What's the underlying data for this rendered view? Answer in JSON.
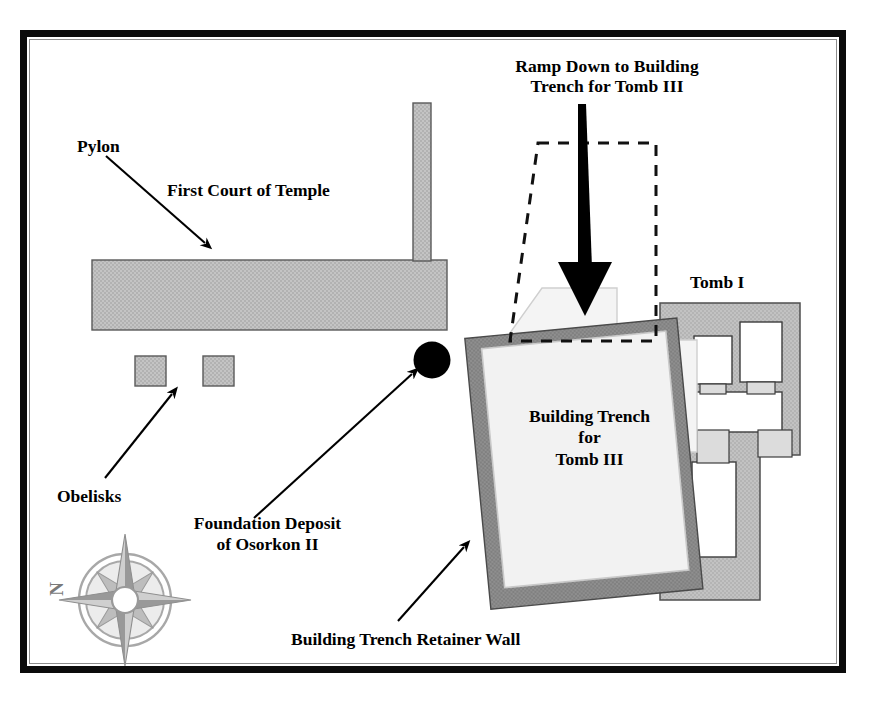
{
  "figure": {
    "kind": "archaeological-site-plan"
  },
  "frame": {
    "outer_color": "#0b0b0b",
    "inner_color": "#8d8d8d",
    "background": "#ffffff"
  },
  "labels": {
    "ramp_down": "Ramp Down to Building\nTrench for Tomb III",
    "pylon": "Pylon",
    "first_court": "First Court of Temple",
    "tomb_i": "Tomb I",
    "building_trench": "Building Trench\nfor\nTomb III",
    "obelisks": "Obelisks",
    "foundation_deposit": "Foundation Deposit\nof Osorkon II",
    "retainer_wall": "Building Trench Retainer Wall",
    "north": "N"
  },
  "colors": {
    "masonry_grey": "#bdbdbd",
    "masonry_stroke": "#555555",
    "tomb_body_grey": "#bcbcbc",
    "chamber_white": "#ffffff",
    "passage_grey": "#d9d9d9",
    "trench_fill": "#f2f2f2",
    "trench_under_fill": "#f5f5f5",
    "retainer_wall_grey": "#8a8a8a",
    "deposit_black": "#000000",
    "arrow_black": "#000000",
    "dashed_outline": "#111111",
    "compass_grey": "#9b9b9b",
    "compass_light": "#cfcfcf"
  },
  "features": [
    {
      "name": "pylon",
      "type": "masonry-bar",
      "label": "Pylon"
    },
    {
      "name": "first-court",
      "type": "open-court",
      "label": "First Court of Temple"
    },
    {
      "name": "temple-wall",
      "type": "masonry-wall"
    },
    {
      "name": "obelisk-left",
      "type": "obelisk-base"
    },
    {
      "name": "obelisk-right",
      "type": "obelisk-base"
    },
    {
      "name": "foundation-deposit",
      "type": "deposit-marker",
      "label": "Foundation Deposit of Osorkon II"
    },
    {
      "name": "building-trench-tomb-iii",
      "type": "trench",
      "label": "Building Trench for Tomb III"
    },
    {
      "name": "building-trench-retainer-wall",
      "type": "retaining-wall",
      "label": "Building Trench Retainer Wall"
    },
    {
      "name": "ramp-outline",
      "type": "dashed-projection",
      "label": "Ramp Down to Building Trench for Tomb III"
    },
    {
      "name": "tomb-i",
      "type": "tomb",
      "label": "Tomb I",
      "chambers": 5
    },
    {
      "name": "compass-rose",
      "type": "north-arrow",
      "label": "N"
    }
  ]
}
